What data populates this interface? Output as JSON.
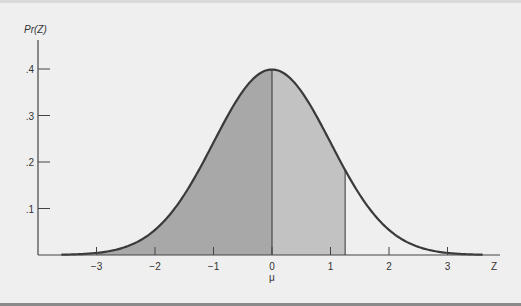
{
  "chart_data": {
    "type": "area",
    "title": "",
    "subtitle": "",
    "xlabel": "Z",
    "ylabel": "Pr(Z)",
    "x_ticks": [
      -3,
      -2,
      -1,
      0,
      1,
      2,
      3
    ],
    "x_tick_labels": [
      "−3",
      "−2",
      "−1",
      "0",
      "1",
      "2",
      "3"
    ],
    "x_annotation_under_zero": "μ",
    "y_ticks": [
      0.1,
      0.2,
      0.3,
      0.4
    ],
    "y_tick_labels": [
      ".1",
      ".2",
      ".3",
      ".4"
    ],
    "xlim": [
      -3.7,
      3.7
    ],
    "ylim": [
      0,
      0.45
    ],
    "grid": false,
    "legend": null,
    "series": [
      {
        "name": "Standard normal density",
        "function": "pdf(z) = exp(-z^2/2)/sqrt(2*pi)",
        "x_range": [
          -3.6,
          3.6
        ],
        "x": [
          -3.6,
          -3,
          -2.5,
          -2,
          -1.5,
          -1,
          -0.5,
          0,
          0.5,
          1,
          1.25,
          1.5,
          2,
          2.5,
          3,
          3.6
        ],
        "y": [
          0.0006,
          0.0044,
          0.0175,
          0.054,
          0.1295,
          0.242,
          0.3521,
          0.3989,
          0.3521,
          0.242,
          0.1826,
          0.1295,
          0.054,
          0.0175,
          0.0044,
          0.0006
        ]
      }
    ],
    "shaded_regions": [
      {
        "from": -3,
        "to": 0,
        "shade": "dark",
        "color": "#a8a8a8"
      },
      {
        "from": 0,
        "to": 1.25,
        "shade": "light",
        "color": "#c2c2c2"
      }
    ],
    "vertical_lines": [
      0,
      1.25
    ]
  },
  "colors": {
    "background": "#efefef",
    "curve": "#3a3a3a",
    "axis": "#444444",
    "shade_dark": "#a8a8a8",
    "shade_light": "#c2c2c2"
  }
}
